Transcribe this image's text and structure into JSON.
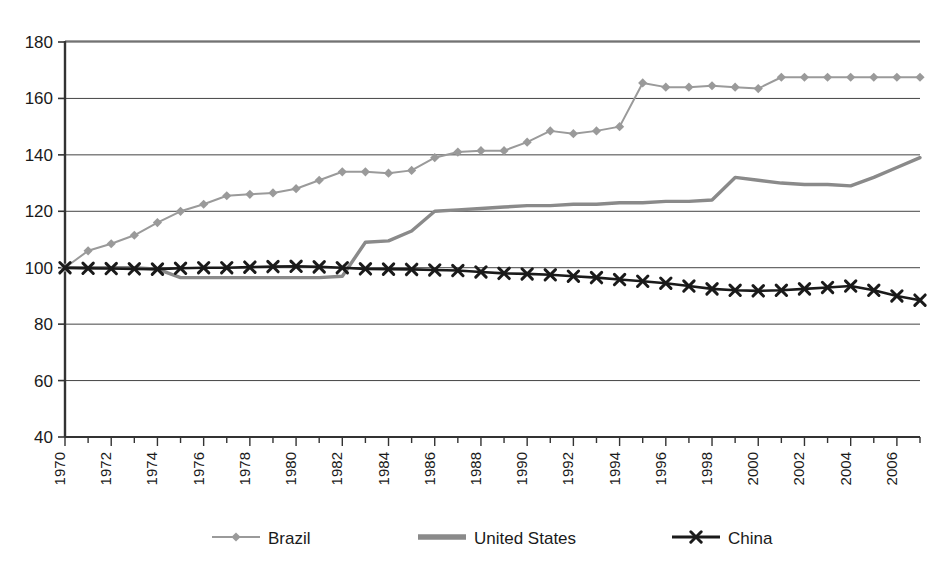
{
  "chart_data": {
    "type": "line",
    "title": "",
    "subtitle": "",
    "xlabel": "",
    "ylabel": "",
    "xlim": [
      1970,
      2007
    ],
    "ylim": [
      40,
      180
    ],
    "ytick_step": 20,
    "ytick_labels": [
      "180",
      "160",
      "140",
      "120",
      "100",
      "80",
      "60",
      "40"
    ],
    "ytick_values": [
      180,
      160,
      140,
      120,
      100,
      80,
      60,
      40
    ],
    "xtick_labels": [
      "1970",
      "1972",
      "1974",
      "1976",
      "1978",
      "1980",
      "1982",
      "1984",
      "1986",
      "1988",
      "1990",
      "1992",
      "1994",
      "1996",
      "1998",
      "2000",
      "2002",
      "2004",
      "2006"
    ],
    "xtick_values": [
      1970,
      1972,
      1974,
      1976,
      1978,
      1980,
      1982,
      1984,
      1986,
      1988,
      1990,
      1992,
      1994,
      1996,
      1998,
      2000,
      2002,
      2004,
      2006
    ],
    "xtick_rotation": -90,
    "minor_ticks_every": 1,
    "grid": "horizontal",
    "legend_position": "bottom",
    "x": [
      1970,
      1971,
      1972,
      1973,
      1974,
      1975,
      1976,
      1977,
      1978,
      1979,
      1980,
      1981,
      1982,
      1983,
      1984,
      1985,
      1986,
      1987,
      1988,
      1989,
      1990,
      1991,
      1992,
      1993,
      1994,
      1995,
      1996,
      1997,
      1998,
      1999,
      2000,
      2001,
      2002,
      2003,
      2004,
      2005,
      2006,
      2007
    ],
    "series": [
      {
        "name": "Brazil",
        "color": "#9a9a9a",
        "marker": "diamond",
        "values": [
          100,
          106,
          108.5,
          111.5,
          116,
          120,
          122.5,
          125.5,
          126,
          126.5,
          128,
          131,
          134,
          134,
          133.5,
          134.5,
          139,
          141,
          141.5,
          141.5,
          144.5,
          148.5,
          147.5,
          148.5,
          150,
          165.5,
          164,
          164,
          164.5,
          164,
          163.5,
          167.5,
          167.5,
          167.5,
          167.5,
          167.5,
          167.5,
          167.5
        ]
      },
      {
        "name": "United States",
        "color": "#8a8a8a",
        "marker": "none",
        "values": [
          100,
          100,
          100,
          100,
          99.5,
          96.5,
          96.5,
          96.5,
          96.5,
          96.5,
          96.5,
          96.5,
          97,
          109,
          109.5,
          113,
          120,
          120.5,
          121,
          121.5,
          122,
          122,
          122.5,
          122.5,
          123,
          123,
          123.5,
          123.5,
          124,
          132,
          131,
          130,
          129.5,
          129.5,
          129,
          132,
          135.5,
          139
        ]
      },
      {
        "name": "China",
        "color": "#1a1a1a",
        "marker": "x",
        "values": [
          100,
          99.8,
          99.7,
          99.6,
          99.5,
          99.8,
          100,
          100,
          100.2,
          100.4,
          100.5,
          100.3,
          100,
          99.6,
          99.5,
          99.4,
          99.2,
          99,
          98.5,
          98,
          97.8,
          97.5,
          97,
          96.5,
          95.8,
          95.2,
          94.5,
          93.5,
          92.5,
          92,
          91.8,
          92,
          92.5,
          93,
          93.5,
          92,
          90,
          88.5
        ]
      }
    ]
  },
  "legend": {
    "items": [
      {
        "label": "Brazil"
      },
      {
        "label": "United States"
      },
      {
        "label": "China"
      }
    ]
  }
}
